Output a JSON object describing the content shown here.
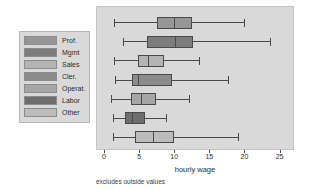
{
  "chart_data": {
    "type": "box",
    "title": "",
    "xlabel": "hourly wage",
    "ylabel": "",
    "footnote": "excludes outside values",
    "xlim": [
      0,
      26.2
    ],
    "grid": false,
    "legend_position": "left-outside",
    "xticks": [
      {
        "value": 0,
        "label": "0"
      },
      {
        "value": 5,
        "label": "5"
      },
      {
        "value": 10,
        "label": "10"
      },
      {
        "value": 15,
        "label": "15"
      },
      {
        "value": 20,
        "label": "20"
      },
      {
        "value": 25,
        "label": "25"
      }
    ],
    "categories": [
      "Prof.",
      "Mgmt",
      "Sales",
      "Cler.",
      "Operat.",
      "Labor",
      "Other"
    ],
    "boxes": [
      {
        "name": "Prof.",
        "whisker_low": 1.3,
        "q1": 7.5,
        "median": 9.9,
        "q3": 12.3,
        "whisker_high": 19.9,
        "color": "#969696"
      },
      {
        "name": "Mgmt",
        "whisker_low": 2.6,
        "q1": 6.0,
        "median": 10.0,
        "q3": 12.4,
        "whisker_high": 23.6,
        "color": "#7d7d7d"
      },
      {
        "name": "Sales",
        "whisker_low": 1.3,
        "q1": 4.8,
        "median": 6.2,
        "q3": 8.4,
        "whisker_high": 13.4,
        "color": "#b4b4b4"
      },
      {
        "name": "Cler.",
        "whisker_low": 1.5,
        "q1": 3.9,
        "median": 4.8,
        "q3": 9.4,
        "whisker_high": 17.6,
        "color": "#8c8c8c"
      },
      {
        "name": "Operat.",
        "whisker_low": 0.9,
        "q1": 3.8,
        "median": 5.2,
        "q3": 7.2,
        "whisker_high": 12.1,
        "color": "#a6a6a6"
      },
      {
        "name": "Labor",
        "whisker_low": 1.2,
        "q1": 2.9,
        "median": 3.9,
        "q3": 5.6,
        "whisker_high": 8.8,
        "color": "#6e6e6e"
      },
      {
        "name": "Other",
        "whisker_low": 1.2,
        "q1": 4.3,
        "median": 6.9,
        "q3": 9.8,
        "whisker_high": 19.0,
        "color": "#bcbcbc"
      }
    ]
  },
  "legend": {
    "items": [
      {
        "label": "Prof.",
        "color": "#969696"
      },
      {
        "label": "Mgmt",
        "color": "#7d7d7d"
      },
      {
        "label": "Sales",
        "color": "#b4b4b4"
      },
      {
        "label": "Cler.",
        "color": "#8c8c8c"
      },
      {
        "label": "Operat.",
        "color": "#a6a6a6"
      },
      {
        "label": "Labor",
        "color": "#6e6e6e"
      },
      {
        "label": "Other",
        "color": "#bcbcbc"
      }
    ]
  },
  "colors": {
    "panel_background": "#d9d9d9",
    "legend_background": "#d9d9d9",
    "line": "#4a4a4a",
    "text": "#2b2b2b"
  }
}
